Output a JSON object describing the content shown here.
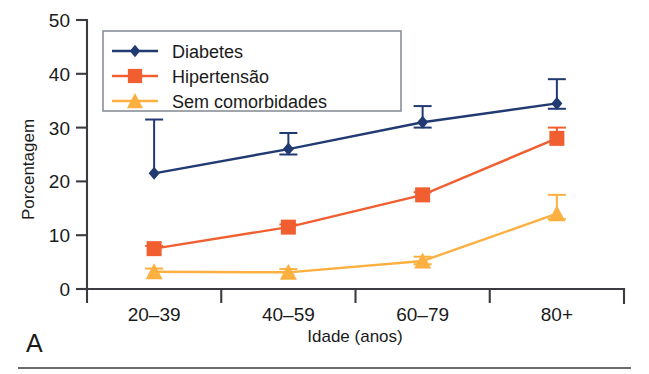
{
  "figure": {
    "panel_label": "A",
    "background_color": "#ffffff",
    "axis_color": "#3b3b42",
    "rule_color": "#3a3a3a"
  },
  "chart_data": {
    "type": "line",
    "title": "",
    "subtitle": "",
    "xlabel": "Idade (anos)",
    "ylabel": "Porcentagem",
    "categories": [
      "20–39",
      "40–59",
      "60–79",
      "80+"
    ],
    "ylim": [
      0,
      50
    ],
    "yticks": [
      0,
      10,
      20,
      30,
      40,
      50
    ],
    "ytick_labels": [
      "0",
      "10",
      "20",
      "30",
      "40",
      "50"
    ],
    "grid": false,
    "legend_position": "upper-left-inside",
    "error_bars": true,
    "series": [
      {
        "name": "Diabetes",
        "color": "#223A72",
        "marker": "diamond",
        "values": [
          21.5,
          26.0,
          31.0,
          34.5
        ],
        "err_low": [
          21.5,
          25.0,
          30.0,
          33.5
        ],
        "err_high": [
          31.5,
          29.0,
          34.0,
          39.0
        ]
      },
      {
        "name": "Hipertensão",
        "color": "#F15F30",
        "marker": "square",
        "values": [
          7.5,
          11.5,
          17.5,
          28.0
        ],
        "err_low": [
          7.0,
          11.0,
          17.0,
          27.5
        ],
        "err_high": [
          8.0,
          12.0,
          18.0,
          30.0
        ]
      },
      {
        "name": "Sem comorbidades",
        "color": "#FBB040",
        "marker": "triangle",
        "values": [
          3.2,
          3.1,
          5.2,
          14.0
        ],
        "err_low": [
          2.8,
          2.7,
          4.6,
          13.0
        ],
        "err_high": [
          3.8,
          3.7,
          6.0,
          17.5
        ]
      }
    ]
  }
}
